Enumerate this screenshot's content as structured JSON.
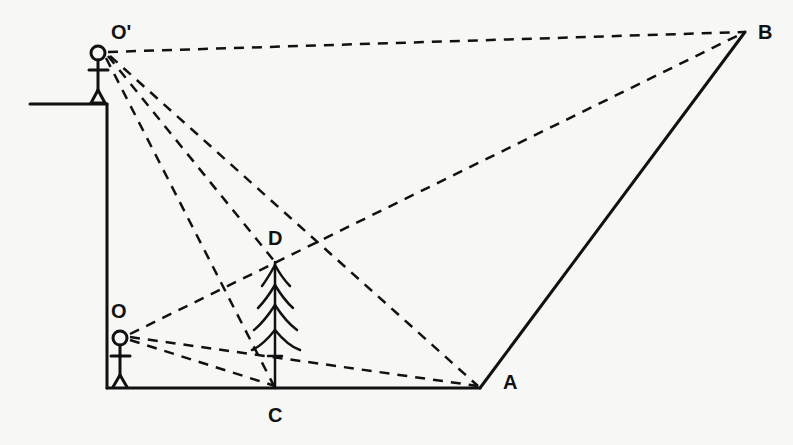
{
  "diagram": {
    "colors": {
      "ink": "#111111",
      "background": "#f7f7f5"
    },
    "points": {
      "O_prime": {
        "label": "O'"
      },
      "O": {
        "label": "O"
      },
      "A": {
        "label": "A"
      },
      "B": {
        "label": "B"
      },
      "C": {
        "label": "C"
      },
      "D": {
        "label": "D"
      }
    },
    "elements": [
      "observer-on-cliff-O-prime",
      "observer-at-base-O",
      "cliff-wall",
      "ground-line",
      "tree-CD",
      "slope-AB",
      "sightlines-dashed"
    ],
    "sightlines": [
      {
        "from": "O'",
        "to": "B"
      },
      {
        "from": "O'",
        "to": "D"
      },
      {
        "from": "O'",
        "to": "C"
      },
      {
        "from": "O'",
        "to": "A"
      },
      {
        "from": "O",
        "to": "B"
      },
      {
        "from": "O",
        "to": "D"
      },
      {
        "from": "O",
        "to": "C"
      },
      {
        "from": "O",
        "to": "A"
      }
    ]
  }
}
